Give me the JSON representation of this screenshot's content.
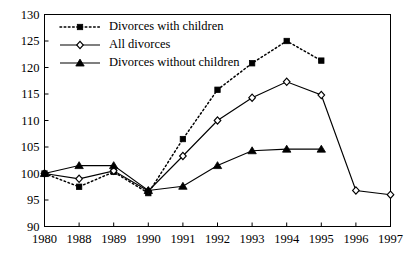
{
  "chart_data": {
    "type": "line",
    "title": "",
    "xlabel": "",
    "ylabel": "",
    "categories": [
      "1980",
      "1988",
      "1989",
      "1990",
      "1991",
      "1992",
      "1993",
      "1994",
      "1995",
      "1996",
      "1997"
    ],
    "ylim": [
      90,
      130
    ],
    "y_ticks": [
      90,
      95,
      100,
      105,
      110,
      115,
      120,
      125,
      130
    ],
    "grid": false,
    "legend_position": "top-left",
    "series": [
      {
        "name": "Divorces with children",
        "marker": "filled-square",
        "line_style": "dotted",
        "color": "#000000",
        "x": [
          "1980",
          "1988",
          "1989",
          "1990",
          "1991",
          "1992",
          "1993",
          "1994",
          "1995"
        ],
        "values": [
          100.0,
          97.5,
          100.3,
          96.3,
          106.5,
          115.8,
          120.8,
          125.0,
          121.3
        ]
      },
      {
        "name": "All divorces",
        "marker": "open-diamond",
        "line_style": "solid",
        "color": "#000000",
        "x": [
          "1980",
          "1988",
          "1989",
          "1990",
          "1991",
          "1992",
          "1993",
          "1994",
          "1995",
          "1996",
          "1997"
        ],
        "values": [
          100.0,
          99.0,
          100.5,
          96.7,
          103.3,
          110.0,
          114.3,
          117.3,
          114.8,
          96.8,
          96.0
        ]
      },
      {
        "name": "Divorces without children",
        "marker": "filled-triangle",
        "line_style": "solid",
        "color": "#000000",
        "x": [
          "1980",
          "1988",
          "1989",
          "1990",
          "1991",
          "1992",
          "1993",
          "1994",
          "1995"
        ],
        "values": [
          100.0,
          101.5,
          101.5,
          96.8,
          97.6,
          101.5,
          104.3,
          104.6,
          104.6
        ]
      }
    ]
  },
  "y_tick_labels": [
    "130",
    "125",
    "120",
    "115",
    "110",
    "105",
    "100",
    "95",
    "90"
  ],
  "legend": {
    "entries": [
      {
        "label": "Divorces with children"
      },
      {
        "label": "All divorces"
      },
      {
        "label": "Divorces without children"
      }
    ]
  }
}
